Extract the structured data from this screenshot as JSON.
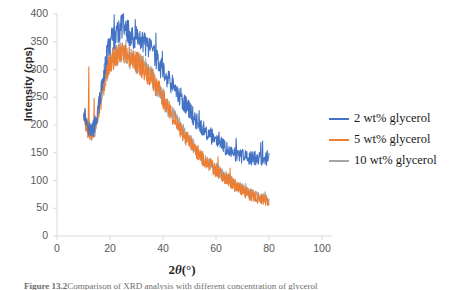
{
  "chart_data": {
    "type": "line",
    "title": "",
    "xlabel": "2θ(°)",
    "ylabel": "Intensity (cps)",
    "xlim": [
      0,
      100
    ],
    "ylim": [
      0,
      400
    ],
    "xticks": [
      0,
      20,
      40,
      60,
      80,
      100
    ],
    "yticks": [
      0,
      50,
      100,
      150,
      200,
      250,
      300,
      350,
      400
    ],
    "grid": false,
    "legend_position": "right",
    "x_range_data": [
      10,
      80
    ],
    "series": [
      {
        "name": "2 wt% glycerol",
        "color": "#4472C4",
        "x": [
          10,
          11,
          12,
          13,
          14,
          15,
          16,
          17,
          18,
          19,
          20,
          21,
          22,
          23,
          24,
          25,
          26,
          27,
          28,
          29,
          30,
          31,
          32,
          33,
          34,
          35,
          36,
          37,
          38,
          39,
          40,
          42,
          44,
          46,
          48,
          50,
          52,
          54,
          56,
          58,
          60,
          62,
          64,
          66,
          68,
          70,
          72,
          74,
          76,
          78,
          80
        ],
        "values": [
          228,
          210,
          196,
          190,
          196,
          215,
          240,
          268,
          300,
          330,
          348,
          355,
          360,
          368,
          372,
          378,
          370,
          366,
          362,
          358,
          355,
          350,
          352,
          346,
          340,
          335,
          330,
          322,
          315,
          305,
          296,
          282,
          268,
          254,
          240,
          226,
          212,
          200,
          190,
          180,
          172,
          164,
          156,
          150,
          146,
          143,
          141,
          140,
          139,
          140,
          141
        ]
      },
      {
        "name": "5 wt% glycerol",
        "color": "#ED7D31",
        "x": [
          10,
          11,
          12,
          13,
          14,
          15,
          16,
          17,
          18,
          19,
          20,
          21,
          22,
          23,
          24,
          25,
          26,
          27,
          28,
          29,
          30,
          31,
          32,
          33,
          34,
          35,
          36,
          37,
          38,
          39,
          40,
          42,
          44,
          46,
          48,
          50,
          52,
          54,
          56,
          58,
          60,
          62,
          64,
          66,
          68,
          70,
          72,
          74,
          76,
          78,
          80
        ],
        "values": [
          215,
          198,
          186,
          182,
          188,
          205,
          228,
          252,
          280,
          300,
          312,
          318,
          322,
          326,
          328,
          330,
          326,
          322,
          318,
          315,
          312,
          308,
          306,
          300,
          294,
          288,
          282,
          274,
          266,
          256,
          246,
          230,
          214,
          198,
          182,
          168,
          155,
          144,
          134,
          126,
          118,
          110,
          102,
          95,
          88,
          82,
          76,
          72,
          68,
          65,
          63
        ]
      },
      {
        "name": "10 wt% glycerol",
        "color": "#A5A5A5",
        "x": [
          10,
          11,
          12,
          13,
          14,
          15,
          16,
          17,
          18,
          19,
          20,
          21,
          22,
          23,
          24,
          25,
          26,
          27,
          28,
          29,
          30,
          31,
          32,
          33,
          34,
          35,
          36,
          37,
          38,
          39,
          40,
          42,
          44,
          46,
          48,
          50,
          52,
          54,
          56,
          58,
          60,
          62,
          64,
          66,
          68,
          70,
          72,
          74,
          76,
          78,
          80
        ],
        "values": [
          220,
          200,
          188,
          184,
          190,
          206,
          230,
          254,
          282,
          302,
          314,
          320,
          324,
          328,
          330,
          332,
          328,
          324,
          320,
          316,
          314,
          310,
          308,
          302,
          296,
          290,
          284,
          276,
          268,
          258,
          248,
          232,
          216,
          200,
          184,
          170,
          157,
          146,
          136,
          128,
          120,
          112,
          104,
          97,
          90,
          84,
          78,
          73,
          69,
          66,
          64
        ]
      }
    ],
    "annotations": [
      {
        "label": "orange-spike",
        "x": 12,
        "y": 305
      },
      {
        "label": "orange-spike-2",
        "x": 14,
        "y": 248
      },
      {
        "label": "blue-max-spike",
        "x": 25,
        "y": 392
      }
    ]
  },
  "axis": {
    "y_title": "Intensity (cps)",
    "x_title_prefix": "2",
    "x_title_theta": "θ",
    "x_title_suffix": "(°)",
    "ytick_labels": [
      "400",
      "350",
      "300",
      "250",
      "200",
      "150",
      "100",
      "50",
      "0"
    ],
    "xtick_labels": [
      "0",
      "20",
      "40",
      "60",
      "80",
      "100"
    ]
  },
  "legend": {
    "items": [
      {
        "label": "2 wt% glycerol",
        "color": "#4472C4"
      },
      {
        "label": "5 wt% glycerol",
        "color": "#ED7D31"
      },
      {
        "label": "10 wt% glycerol",
        "color": "#A5A5A5"
      }
    ]
  },
  "caption": {
    "figure_number": "Figure 13.2",
    "text": "Comparison of XRD analysis with different concentration of glycerol"
  }
}
